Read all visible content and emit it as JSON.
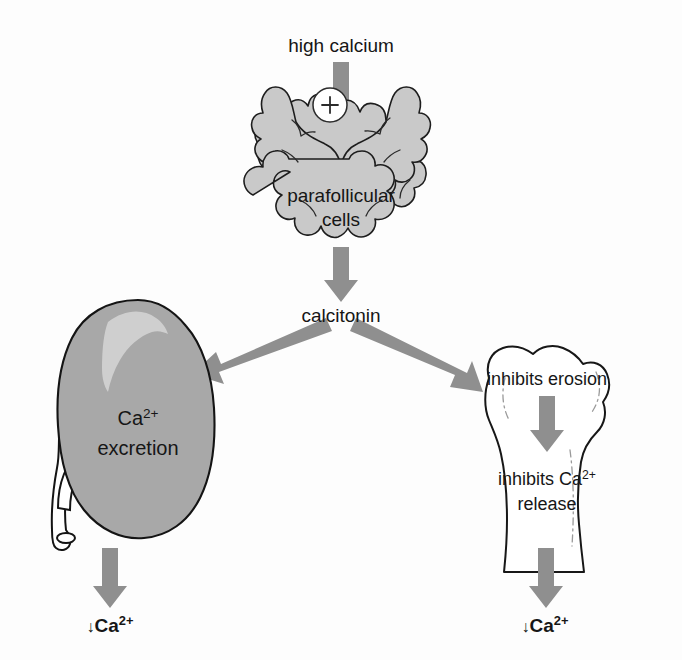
{
  "figure": {
    "background_color": "#fdfdfd",
    "arrow_color": "#8f8f8f",
    "text_color": "#161616"
  },
  "nodes": {
    "stimulus": {
      "label": "high calcium",
      "x": 341,
      "y": 46
    },
    "gland": {
      "label_line1": "parafollicular",
      "label_line2": "cells",
      "organ": "thyroid-gland",
      "fill_color": "#c9c9c9",
      "outline_color": "#1d1d1d",
      "x": 341,
      "y": 196
    },
    "hormone": {
      "label": "calcitonin",
      "x": 341,
      "y": 316
    },
    "kidney": {
      "organ": "kidney",
      "label_line1": "Ca",
      "label_line1_sup": "2+",
      "label_line2": "excretion",
      "fill_color": "#a8a8a8",
      "outline_color": "#141414",
      "x": 133,
      "y": 428
    },
    "bone": {
      "organ": "bone",
      "label_top": "inhibits erosion",
      "label_mid_base": "inhibits Ca",
      "label_mid_sup": "2+",
      "label_mid_line2": "release",
      "fill_color": "#ffffff",
      "outline_color": "#171717",
      "x": 547,
      "y": 460
    },
    "outcome_left": {
      "arrow_symbol": "↓",
      "base": "Ca",
      "sup": "2+",
      "x": 110,
      "y": 625
    },
    "outcome_right": {
      "arrow_symbol": "↓",
      "base": "Ca",
      "sup": "2+",
      "x": 545,
      "y": 625
    }
  },
  "modifiers": {
    "stimulus_sign": {
      "symbol": "+",
      "meaning": "stimulates",
      "x": 330,
      "y": 105
    }
  },
  "arrows": [
    {
      "name": "high-calcium-to-gland",
      "direction": "down",
      "from": [
        341,
        63
      ],
      "to": [
        341,
        165
      ]
    },
    {
      "name": "gland-to-calcitonin",
      "direction": "down",
      "from": [
        341,
        248
      ],
      "to": [
        341,
        300
      ]
    },
    {
      "name": "calcitonin-to-kidney",
      "direction": "down-left",
      "from": [
        326,
        326
      ],
      "to": [
        196,
        372
      ]
    },
    {
      "name": "calcitonin-to-bone",
      "direction": "down-right",
      "from": [
        357,
        326
      ],
      "to": [
        478,
        384
      ]
    },
    {
      "name": "bone-erosion-to-release",
      "direction": "down",
      "from": [
        546,
        395
      ],
      "to": [
        546,
        450
      ]
    },
    {
      "name": "kidney-to-outcome",
      "direction": "down",
      "from": [
        110,
        548
      ],
      "to": [
        110,
        605
      ]
    },
    {
      "name": "bone-to-outcome",
      "direction": "down",
      "from": [
        546,
        548
      ],
      "to": [
        546,
        605
      ]
    }
  ]
}
